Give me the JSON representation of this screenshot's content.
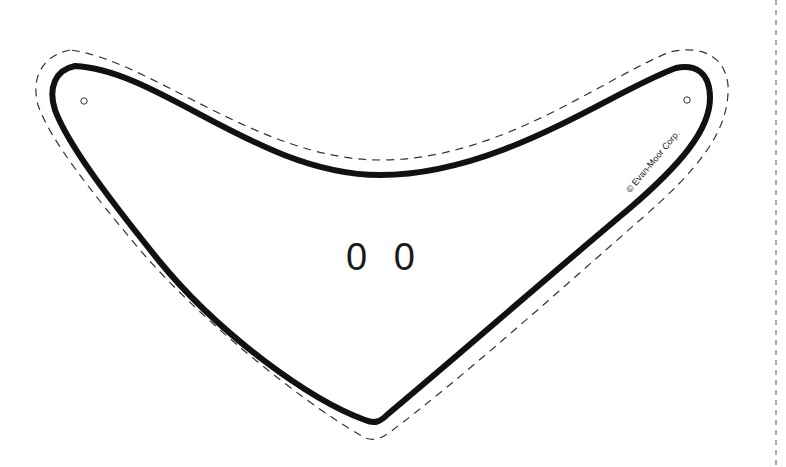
{
  "page": {
    "copyright": "© Evan-Moor Corp.",
    "eyes_text": "0 0",
    "colors": {
      "outline": "#111111",
      "cut_line": "#333333",
      "background": "#ffffff"
    },
    "icons": [
      "hole-punch-left",
      "hole-punch-right",
      "fold-line"
    ]
  }
}
